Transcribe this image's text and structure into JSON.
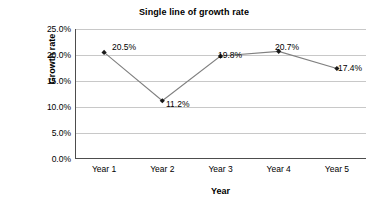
{
  "chart_data": {
    "type": "line",
    "title": "Single line of growth rate",
    "xlabel": "Year",
    "ylabel": "Growth rate",
    "categories": [
      "Year 1",
      "Year 2",
      "Year 3",
      "Year 4",
      "Year 5"
    ],
    "values": [
      20.5,
      11.2,
      19.8,
      20.7,
      17.4
    ],
    "point_labels": [
      "20.5%",
      "11.2%",
      "19.8%",
      "20.7%",
      "17.4%"
    ],
    "ylim": [
      0,
      25
    ],
    "ytick_values": [
      25,
      20,
      15,
      10,
      5,
      0
    ],
    "ytick_labels": [
      "25.0%",
      "20.0%",
      "15.0%",
      "10.0%",
      "5.0%",
      "0.0%"
    ],
    "grid": "horizontal",
    "legend": "none",
    "series_name": "Growth rate",
    "colors": {
      "line": "#808080",
      "marker": "#1a1a1a",
      "gridline": "#c8c8c8",
      "axis": "#000000",
      "background": "#ffffff",
      "text": "#000000"
    },
    "marker_shape": "diamond",
    "label_positions": [
      {
        "label": "20.5%",
        "left": 112,
        "top": 43
      },
      {
        "label": "11.2%",
        "left": 166,
        "top": 100
      },
      {
        "label": "19.8%",
        "left": 218,
        "top": 51
      },
      {
        "label": "20.7%",
        "left": 275,
        "top": 43
      },
      {
        "label": "17.4%",
        "left": 338,
        "top": 64
      }
    ]
  }
}
